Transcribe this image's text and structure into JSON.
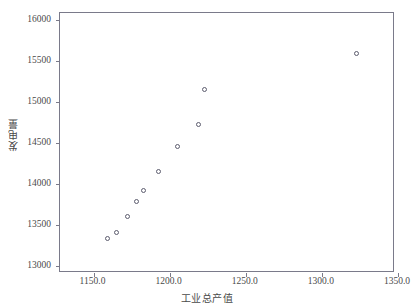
{
  "chart_data": {
    "type": "scatter",
    "title": "",
    "xlabel": "工业总产值",
    "ylabel": "发电量",
    "xlim": [
      1128,
      1348
    ],
    "ylim": [
      12910,
      16090
    ],
    "grid": false,
    "legend": null,
    "marker": "open-circle",
    "marker_color": "#5c5c6e",
    "frame_color": "#7a7a8a",
    "background": "#ffffff",
    "xticks": [
      1150.0,
      1200.0,
      1250.0,
      1300.0,
      1350.0
    ],
    "xtick_labels": [
      "1150.0",
      "1200.0",
      "1250.0",
      "1300.0",
      "1350.0"
    ],
    "yticks": [
      13000,
      13500,
      14000,
      14500,
      15000,
      15500,
      16000
    ],
    "ytick_labels": [
      "13000",
      "13500",
      "14000",
      "14500",
      "15000",
      "15500",
      "16000"
    ],
    "x": [
      1159,
      1165,
      1172,
      1178,
      1183,
      1193,
      1205,
      1219,
      1223,
      1323
    ],
    "y": [
      13330,
      13400,
      13600,
      13790,
      13920,
      14150,
      14460,
      14730,
      15150,
      15600
    ],
    "points": [
      {
        "x": 1159,
        "y": 13330
      },
      {
        "x": 1165,
        "y": 13400
      },
      {
        "x": 1172,
        "y": 13600
      },
      {
        "x": 1178,
        "y": 13790
      },
      {
        "x": 1183,
        "y": 13920
      },
      {
        "x": 1193,
        "y": 14150
      },
      {
        "x": 1205,
        "y": 14460
      },
      {
        "x": 1219,
        "y": 14730
      },
      {
        "x": 1223,
        "y": 15150
      },
      {
        "x": 1323,
        "y": 15600
      }
    ]
  }
}
